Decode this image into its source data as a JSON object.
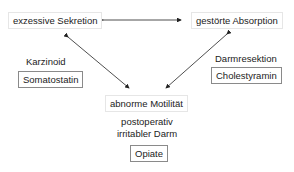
{
  "nodes": {
    "secretion": "exzessive Sekretion",
    "absorption": "gestörte Absorption",
    "motility": "abnorme Motilität"
  },
  "causes": {
    "secretion": "Karzinoid",
    "absorption": "Darmresektion",
    "motility_line1": "postoperativ",
    "motility_line2": "irritabler Darm"
  },
  "treatments": {
    "secretion": "Somatostatin",
    "absorption": "Cholestyramin",
    "motility": "Opiate"
  }
}
